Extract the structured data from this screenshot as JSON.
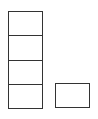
{
  "diagram": {
    "stroke_color": "#333333",
    "background_color": "#ffffff",
    "stack": {
      "x": 8,
      "y": 11,
      "width": 35,
      "cell_height": 24.25,
      "cells": [
        {
          "index": 0
        },
        {
          "index": 1
        },
        {
          "index": 2
        },
        {
          "index": 3
        }
      ]
    },
    "single_block": {
      "x": 55,
      "y": 83,
      "width": 35,
      "height": 25
    }
  }
}
